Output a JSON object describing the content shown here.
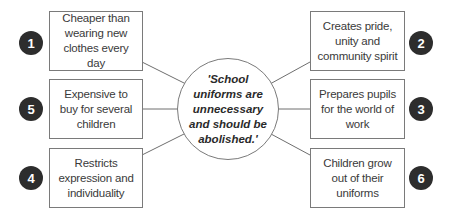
{
  "diagram": {
    "type": "spider-diagram",
    "center": {
      "text": "'School uniforms are unnecessary and should be abolished.'"
    },
    "colors": {
      "number_badge": "#2d2d2d",
      "border": "#7a7a7a",
      "text": "#3a3a3a"
    },
    "nodes": [
      {
        "number": "1",
        "text": "Cheaper than wearing new clothes every day",
        "side": "left",
        "row": 1
      },
      {
        "number": "2",
        "text": "Creates pride, unity and community spirit",
        "side": "right",
        "row": 1
      },
      {
        "number": "3",
        "text": "Prepares pupils for the world of work",
        "side": "right",
        "row": 2
      },
      {
        "number": "4",
        "text": "Restricts expression and individuality",
        "side": "left",
        "row": 3
      },
      {
        "number": "5",
        "text": "Expensive to buy for several children",
        "side": "left",
        "row": 2
      },
      {
        "number": "6",
        "text": "Children grow out of their uniforms",
        "side": "right",
        "row": 3
      }
    ]
  }
}
